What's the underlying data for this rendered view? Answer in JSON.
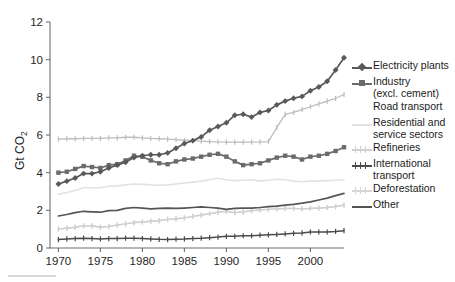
{
  "chart_data": {
    "type": "line",
    "title": "",
    "xlabel": "",
    "ylabel": "Gt CO2",
    "ylabel_main": "Gt CO",
    "ylabel_subscript": "2",
    "xlim": [
      1969,
      2004
    ],
    "ylim": [
      0,
      12
    ],
    "yticks": [
      0,
      2,
      4,
      6,
      8,
      10,
      12
    ],
    "ytick_labels": [
      "0",
      "2",
      "4",
      "6",
      "8",
      "10",
      "12"
    ],
    "xticks": [
      1970,
      1975,
      1980,
      1985,
      1990,
      1995,
      2000
    ],
    "xtick_labels": [
      "1970",
      "1975",
      "1980",
      "1985",
      "1990",
      "1995",
      "2000"
    ],
    "grid": false,
    "legend_position": "right",
    "x": [
      1970,
      1971,
      1972,
      1973,
      1974,
      1975,
      1976,
      1977,
      1978,
      1979,
      1980,
      1981,
      1982,
      1983,
      1984,
      1985,
      1986,
      1987,
      1988,
      1989,
      1990,
      1991,
      1992,
      1993,
      1994,
      1995,
      1996,
      1997,
      1998,
      1999,
      2000,
      2001,
      2002,
      2003,
      2004
    ],
    "series": [
      {
        "name": "Electricity plants",
        "color": "#595959",
        "marker": "diamond",
        "width": 1.7,
        "values": [
          3.4,
          3.55,
          3.72,
          3.95,
          3.95,
          4.05,
          4.25,
          4.4,
          4.55,
          4.8,
          4.9,
          4.95,
          4.95,
          5.05,
          5.3,
          5.55,
          5.7,
          5.9,
          6.25,
          6.45,
          6.65,
          7.05,
          7.1,
          6.95,
          7.2,
          7.3,
          7.6,
          7.8,
          7.95,
          8.05,
          8.35,
          8.55,
          8.85,
          9.45,
          10.1
        ]
      },
      {
        "name": "Industry\n(excl. cement)",
        "label_line1": "Industry",
        "label_line2": "(excl. cement)",
        "color": "#6b6b6b",
        "marker": "square",
        "width": 1.7,
        "values": [
          4.0,
          4.05,
          4.2,
          4.35,
          4.3,
          4.25,
          4.4,
          4.45,
          4.65,
          4.9,
          4.85,
          4.65,
          4.5,
          4.45,
          4.6,
          4.7,
          4.75,
          4.85,
          4.95,
          5.0,
          4.85,
          4.6,
          4.4,
          4.45,
          4.5,
          4.65,
          4.8,
          4.9,
          4.85,
          4.7,
          4.85,
          4.9,
          5.0,
          5.15,
          5.35
        ]
      },
      {
        "name": "Road transport",
        "color": "#bdbdbd",
        "marker": "plus",
        "width": 1.3,
        "values": [
          5.78,
          5.8,
          5.8,
          5.82,
          5.82,
          5.82,
          5.85,
          5.85,
          5.88,
          5.88,
          5.85,
          5.82,
          5.8,
          5.78,
          5.75,
          5.72,
          5.7,
          5.68,
          5.65,
          5.63,
          5.62,
          5.62,
          5.62,
          5.62,
          5.63,
          5.65,
          6.4,
          7.1,
          7.2,
          7.35,
          7.5,
          7.65,
          7.8,
          7.95,
          8.15
        ]
      },
      {
        "name": "Residential and\nservice sectors",
        "label_line1": "Residential and",
        "label_line2": "service sectors",
        "color": "#e2e2e2",
        "marker": "none",
        "width": 1.6,
        "values": [
          2.85,
          2.95,
          3.05,
          3.2,
          3.2,
          3.2,
          3.28,
          3.3,
          3.35,
          3.4,
          3.38,
          3.35,
          3.33,
          3.35,
          3.4,
          3.45,
          3.5,
          3.55,
          3.62,
          3.7,
          3.62,
          3.58,
          3.6,
          3.62,
          3.55,
          3.6,
          3.65,
          3.62,
          3.55,
          3.52,
          3.55,
          3.55,
          3.58,
          3.6,
          3.62
        ]
      },
      {
        "name": "Refineries",
        "color": "#cfcfcf",
        "marker": "plus",
        "width": 1.3,
        "values": [
          1.0,
          1.05,
          1.1,
          1.18,
          1.18,
          1.1,
          1.15,
          1.22,
          1.28,
          1.35,
          1.38,
          1.42,
          1.45,
          1.52,
          1.55,
          1.6,
          1.68,
          1.75,
          1.82,
          1.9,
          1.95,
          1.88,
          1.92,
          1.98,
          2.02,
          2.05,
          2.08,
          2.1,
          2.1,
          2.08,
          2.1,
          2.12,
          2.15,
          2.2,
          2.28
        ]
      },
      {
        "name": "International\ntransport",
        "label_line1": "International",
        "label_line2": "transport",
        "color": "#4a4a4a",
        "marker": "plus",
        "width": 1.5,
        "values": [
          0.45,
          0.48,
          0.5,
          0.52,
          0.5,
          0.48,
          0.5,
          0.5,
          0.52,
          0.52,
          0.5,
          0.48,
          0.46,
          0.45,
          0.47,
          0.48,
          0.5,
          0.52,
          0.55,
          0.58,
          0.62,
          0.62,
          0.65,
          0.65,
          0.68,
          0.7,
          0.72,
          0.75,
          0.78,
          0.8,
          0.85,
          0.85,
          0.85,
          0.88,
          0.92
        ]
      },
      {
        "name": "Deforestation",
        "color": "#d6d6d6",
        "marker": "plus",
        "width": 1.4,
        "values": [
          1.0,
          1.05,
          1.1,
          1.18,
          1.18,
          1.1,
          1.15,
          1.22,
          1.28,
          1.35,
          1.38,
          1.42,
          1.45,
          1.52,
          1.55,
          1.6,
          1.68,
          1.75,
          1.82,
          1.9,
          1.95,
          1.88,
          1.92,
          1.98,
          2.02,
          2.05,
          2.08,
          2.1,
          2.1,
          2.08,
          2.1,
          2.12,
          2.15,
          2.2,
          2.28
        ]
      },
      {
        "name": "Other",
        "color": "#555555",
        "marker": "none",
        "width": 1.7,
        "values": [
          1.7,
          1.78,
          1.88,
          1.95,
          1.92,
          1.9,
          1.98,
          2.0,
          2.1,
          2.15,
          2.12,
          2.08,
          2.1,
          2.12,
          2.1,
          2.12,
          2.15,
          2.18,
          2.15,
          2.12,
          2.05,
          2.1,
          2.12,
          2.12,
          2.15,
          2.2,
          2.22,
          2.28,
          2.32,
          2.38,
          2.45,
          2.55,
          2.65,
          2.78,
          2.9
        ]
      }
    ]
  },
  "legend": {
    "items": [
      {
        "label": "Electricity plants",
        "key": "diamond-line-key",
        "color": "#595959",
        "marker": "diamond"
      },
      {
        "label": "Industry\n(excl. cement)",
        "key": "square-line-key",
        "color": "#6b6b6b",
        "marker": "square"
      },
      {
        "label": "Road transport",
        "key": "blank-key",
        "color": "#ffffff",
        "marker": "none"
      },
      {
        "label": "Residential and\nservice sectors",
        "key": "light-line-key",
        "color": "#e2e2e2",
        "marker": "none"
      },
      {
        "label": "Refineries",
        "key": "plus-light-key",
        "color": "#cfcfcf",
        "marker": "plus"
      },
      {
        "label": "International\ntransport",
        "key": "plus-dark-key",
        "color": "#4a4a4a",
        "marker": "plus"
      },
      {
        "label": "Deforestation",
        "key": "plus-pale-key",
        "color": "#d6d6d6",
        "marker": "plus"
      },
      {
        "label": "Other",
        "key": "solid-dark-key",
        "color": "#555555",
        "marker": "none"
      }
    ]
  },
  "axes": {
    "ylabel_main": "Gt CO",
    "ylabel_subscript": "2"
  }
}
